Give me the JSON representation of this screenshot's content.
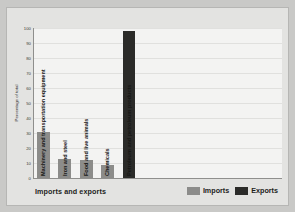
{
  "chart_data": {
    "type": "bar",
    "title": "",
    "xlabel": "Imports and exports",
    "ylabel": "Percentage of total",
    "ylim": [
      0,
      100
    ],
    "yticks": [
      100,
      90,
      80,
      70,
      60,
      50,
      40,
      30,
      20,
      10,
      0
    ],
    "grid": true,
    "legend_position": "bottom-right",
    "categories": [
      "Machinery and transportation equipment",
      "Iron and steel",
      "Food and live animals",
      "Chemicals",
      "Petroleum and petroleum products"
    ],
    "series": [
      {
        "name": "Imports",
        "color": "#8c8c8a",
        "values": [
          31,
          13,
          12,
          9,
          null
        ]
      },
      {
        "name": "Exports",
        "color": "#2b2b29",
        "values": [
          null,
          null,
          null,
          null,
          98
        ]
      }
    ],
    "bars": [
      {
        "category": "Machinery and transportation equipment",
        "series": "Imports",
        "value": 31,
        "color": "#8c8c8a"
      },
      {
        "category": "Iron and steel",
        "series": "Imports",
        "value": 13,
        "color": "#8c8c8a"
      },
      {
        "category": "Food and live animals",
        "series": "Imports",
        "value": 12,
        "color": "#8c8c8a"
      },
      {
        "category": "Chemicals",
        "series": "Imports",
        "value": 9,
        "color": "#8c8c8a"
      },
      {
        "category": "Petroleum and petroleum products",
        "series": "Exports",
        "value": 98,
        "color": "#2b2b29"
      }
    ],
    "legend": [
      {
        "label": "Imports",
        "color": "#8c8c8a"
      },
      {
        "label": "Exports",
        "color": "#2b2b29"
      }
    ]
  }
}
